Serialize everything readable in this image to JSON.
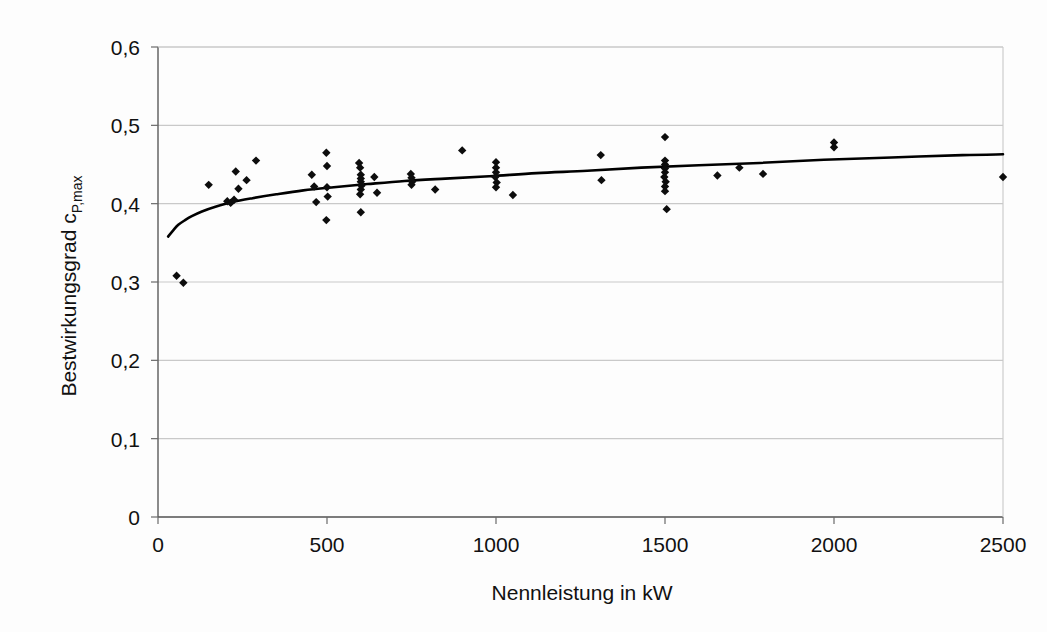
{
  "chart_data": {
    "type": "scatter",
    "title": "",
    "xlabel": "Nennleistung in kW",
    "ylabel": "Bestwirkungsgrad c",
    "ylabel_sub": "P,max",
    "ylabel_full": "Bestwirkungsgrad c_P,max",
    "xlim": [
      0,
      2500
    ],
    "ylim": [
      0,
      0.6
    ],
    "grid": true,
    "legend": false,
    "xticks": [
      0,
      500,
      1000,
      1500,
      2000,
      2500
    ],
    "xtick_labels": [
      "0",
      "500",
      "1000",
      "1500",
      "2000",
      "2500"
    ],
    "yticks": [
      0,
      0.1,
      0.2,
      0.3,
      0.4,
      0.5,
      0.6
    ],
    "ytick_labels": [
      "0",
      "0,1",
      "0,2",
      "0,3",
      "0,4",
      "0,5",
      "0,6"
    ],
    "marker": "diamond",
    "marker_color": "#0d0d0d",
    "curve_color": "#000000",
    "grid_color": "#c9c9c9",
    "axis_color": "#5a5a5a",
    "background": "#fdfdfd",
    "points": [
      [
        55,
        0.308
      ],
      [
        75,
        0.299
      ],
      [
        150,
        0.424
      ],
      [
        205,
        0.403
      ],
      [
        215,
        0.401
      ],
      [
        225,
        0.405
      ],
      [
        230,
        0.441
      ],
      [
        238,
        0.419
      ],
      [
        262,
        0.43
      ],
      [
        290,
        0.455
      ],
      [
        455,
        0.437
      ],
      [
        462,
        0.422
      ],
      [
        468,
        0.402
      ],
      [
        498,
        0.465
      ],
      [
        500,
        0.448
      ],
      [
        500,
        0.421
      ],
      [
        502,
        0.409
      ],
      [
        498,
        0.379
      ],
      [
        595,
        0.452
      ],
      [
        598,
        0.446
      ],
      [
        600,
        0.437
      ],
      [
        600,
        0.432
      ],
      [
        600,
        0.428
      ],
      [
        602,
        0.423
      ],
      [
        600,
        0.418
      ],
      [
        598,
        0.412
      ],
      [
        600,
        0.389
      ],
      [
        640,
        0.434
      ],
      [
        648,
        0.414
      ],
      [
        748,
        0.438
      ],
      [
        750,
        0.433
      ],
      [
        752,
        0.428
      ],
      [
        750,
        0.424
      ],
      [
        820,
        0.418
      ],
      [
        900,
        0.468
      ],
      [
        1000,
        0.453
      ],
      [
        1000,
        0.446
      ],
      [
        1000,
        0.44
      ],
      [
        998,
        0.434
      ],
      [
        1002,
        0.427
      ],
      [
        1000,
        0.421
      ],
      [
        1050,
        0.411
      ],
      [
        1310,
        0.462
      ],
      [
        1312,
        0.43
      ],
      [
        1500,
        0.485
      ],
      [
        1500,
        0.455
      ],
      [
        1500,
        0.45
      ],
      [
        1500,
        0.445
      ],
      [
        1500,
        0.44
      ],
      [
        1498,
        0.434
      ],
      [
        1502,
        0.428
      ],
      [
        1500,
        0.422
      ],
      [
        1500,
        0.416
      ],
      [
        1505,
        0.393
      ],
      [
        1655,
        0.436
      ],
      [
        1720,
        0.446
      ],
      [
        1790,
        0.438
      ],
      [
        2000,
        0.478
      ],
      [
        2000,
        0.472
      ],
      [
        2500,
        0.434
      ]
    ],
    "trend_curve": {
      "label": "regression curve",
      "x": [
        30,
        45,
        60,
        80,
        100,
        130,
        170,
        220,
        280,
        350,
        430,
        520,
        620,
        730,
        850,
        980,
        1120,
        1270,
        1430,
        1600,
        1780,
        1970,
        2170,
        2380,
        2500
      ],
      "y": [
        0.358,
        0.366,
        0.373,
        0.379,
        0.384,
        0.39,
        0.396,
        0.402,
        0.407,
        0.412,
        0.417,
        0.421,
        0.425,
        0.429,
        0.432,
        0.435,
        0.439,
        0.442,
        0.446,
        0.449,
        0.452,
        0.456,
        0.459,
        0.462,
        0.463
      ]
    }
  }
}
